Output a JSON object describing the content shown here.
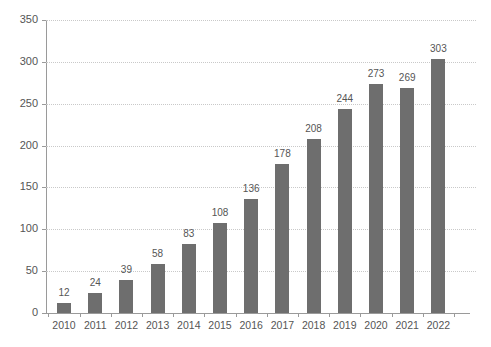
{
  "chart_data": {
    "type": "bar",
    "title": "",
    "subtitle": "",
    "xlabel": "",
    "ylabel": "",
    "categories": [
      "2010",
      "2011",
      "2012",
      "2013",
      "2014",
      "2015",
      "2016",
      "2017",
      "2018",
      "2019",
      "2020",
      "2021",
      "2022"
    ],
    "values": [
      12,
      24,
      39,
      58,
      83,
      108,
      136,
      178,
      208,
      244,
      273,
      269,
      303
    ],
    "data_labels": [
      "12",
      "24",
      "39",
      "58",
      "83",
      "108",
      "136",
      "178",
      "208",
      "244",
      "273",
      "269",
      "303"
    ],
    "ylim": [
      0,
      350
    ],
    "yticks": [
      0,
      50,
      100,
      150,
      200,
      250,
      300,
      350
    ],
    "ytick_labels": [
      "0",
      "50",
      "100",
      "150",
      "200",
      "250",
      "300",
      "350"
    ],
    "grid": true,
    "grid_axis": "y",
    "grid_style": "dotted",
    "legend": false,
    "legend_position": "none",
    "bar_color": "#6e6e6e",
    "grid_color": "#c9c9c9",
    "axis_color": "#9a9a9a",
    "text_color": "#555555",
    "background_color": "#ffffff",
    "show_data_labels": true
  }
}
